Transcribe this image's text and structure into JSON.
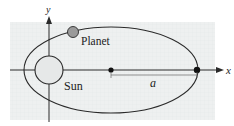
{
  "diagram": {
    "type": "orbital-ellipse",
    "labels": {
      "planet": "Planet",
      "sun": "Sun",
      "semi_major_axis": "a",
      "x_axis": "x",
      "y_axis": "y"
    },
    "colors": {
      "panel": "#eef0f0",
      "line": "#2a2a2a",
      "sun_fill": "#e6e8e8",
      "planet_fill": "#9a9a9a",
      "dot": "#111111"
    }
  }
}
